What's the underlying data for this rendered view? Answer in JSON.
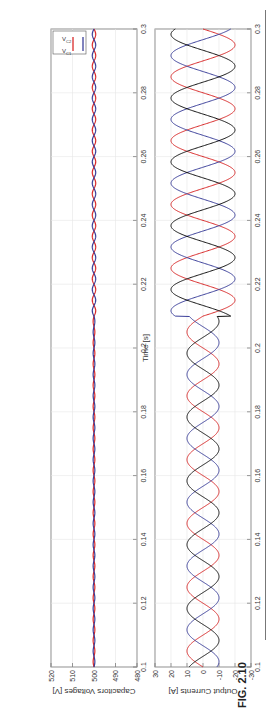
{
  "figure": {
    "caption": "FIG. 2.10",
    "orientation": "rotated-90-ccw"
  },
  "colors": {
    "red": "#d92b2b",
    "blue": "#3b3f9a",
    "black": "#111111",
    "grid": "#e6e6e6",
    "axis": "#555555"
  },
  "chart_data": [
    {
      "type": "line",
      "title": "",
      "xlabel": "",
      "ylabel": "Output Currents [A]",
      "xlim": [
        0.1,
        0.3
      ],
      "ylim": [
        -30,
        30
      ],
      "xticks": [
        "0.1",
        "0.12",
        "0.14",
        "0.16",
        "0.18",
        "0.2",
        "0.22",
        "0.24",
        "0.26",
        "0.28",
        "0.3"
      ],
      "yticks": [
        "-30",
        "-20",
        "-10",
        "0",
        "10",
        "20",
        "30"
      ],
      "grid": true,
      "series": [
        {
          "name": "phase a",
          "color": "red",
          "frequency_hz": 50,
          "amplitude_before_0.21": 10,
          "amplitude_after_0.21": 20,
          "phase_deg": 0
        },
        {
          "name": "phase b",
          "color": "blue",
          "frequency_hz": 50,
          "amplitude_before_0.21": 10,
          "amplitude_after_0.21": 20,
          "phase_deg": -120
        },
        {
          "name": "phase c",
          "color": "black",
          "frequency_hz": 50,
          "amplitude_before_0.21": 10,
          "amplitude_after_0.21": 20,
          "phase_deg": 120
        }
      ],
      "annotations": [
        "step change in current amplitude at t≈0.21 s"
      ]
    },
    {
      "type": "line",
      "title": "",
      "xlabel": "Time [s]",
      "ylabel": "Capacitors Voltages [V]",
      "xlim": [
        0.1,
        0.3
      ],
      "ylim": [
        480,
        520
      ],
      "xticks": [
        "0.1",
        "0.12",
        "0.14",
        "0.16",
        "0.18",
        "0.2",
        "0.22",
        "0.24",
        "0.26",
        "0.28",
        "0.3"
      ],
      "yticks": [
        "480",
        "490",
        "500",
        "510",
        "520"
      ],
      "grid": true,
      "legend": {
        "position": "upper right",
        "entries": [
          "V_C1",
          "V_C2"
        ]
      },
      "series": [
        {
          "name": "V_C1",
          "color": "red",
          "mean": 500,
          "ripple_before_0.21": 0.4,
          "ripple_after_0.21": 0.8
        },
        {
          "name": "V_C2",
          "color": "blue",
          "mean": 500,
          "ripple_before_0.21": 0.4,
          "ripple_after_0.21": 0.8
        }
      ]
    }
  ],
  "labels": {
    "top_ylabel": "Output Currents [A]",
    "bottom_ylabel": "Capacitors Voltages [V]",
    "xlabel": "Time [s]",
    "legend_vc1": "V",
    "legend_vc1_sub": "C1",
    "legend_vc2": "V",
    "legend_vc2_sub": "C2"
  }
}
